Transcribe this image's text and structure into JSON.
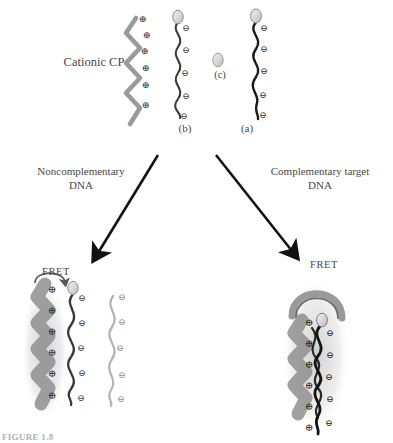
{
  "figure": {
    "caption": "FIGURE 1.8",
    "labels": {
      "cationic_cp": "Cationic CP",
      "noncomplementary_dna": "Noncomplementary\nDNA",
      "complementary_target_dna": "Complementary target\nDNA",
      "panel_a": "(a)",
      "panel_b": "(b)",
      "panel_c": "(c)",
      "fret_left": "FRET",
      "fret_right": "FRET"
    },
    "charge_symbols": {
      "positive": "⊕",
      "negative": "⊖"
    },
    "colors": {
      "cationic_polymer": "#9a9a9a",
      "dna_strand_dark": "#2e2e2e",
      "dna_strand_light": "#b0b0b0",
      "fluorophore_fill": "#dcdcdc",
      "fluorophore_stroke": "#8c8c8c",
      "arrow": "#111111",
      "text": "#4a4646",
      "glow": "#cfcfcf",
      "background": "#ffffff"
    },
    "top_row": {
      "cationic_cp_charges": 6,
      "strand_b_charges": 5,
      "strand_a_charges": 5,
      "strand_b_has_fluorophore": true,
      "strand_a_has_fluorophore": true,
      "panel_c_is_fluorophore_only": true
    },
    "arrows": {
      "left_arrow_label": "to noncomplementary outcome",
      "right_arrow_label": "to complementary outcome"
    },
    "bottom_left_complex": {
      "cp_charges": 6,
      "dna_dark_charges": 5,
      "dna_light_charges": 5,
      "has_glow": true,
      "fret_efficient": false
    },
    "bottom_right_complex": {
      "cp_charges": 6,
      "dna_charges": 5,
      "has_glow": true,
      "fret_efficient": true,
      "duplex": true
    }
  }
}
